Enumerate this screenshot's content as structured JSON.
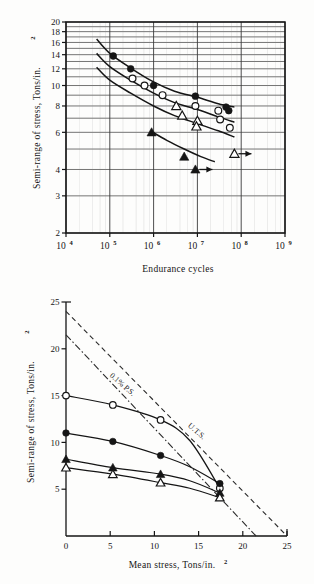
{
  "page": {
    "background_color": "#fdfdfc",
    "ink_color": "#151515"
  },
  "figures": [
    {
      "id": "endurance-curve",
      "chart_data": {
        "type": "line",
        "title": "",
        "subtitle": "",
        "xlabel": "Endurance cycles",
        "ylabel": "Semi-range of stress, Tons/in.",
        "ylabel_sup": "2",
        "xscale": "log",
        "yscale": "log",
        "xlim": [
          10000,
          1000000000
        ],
        "ylim": [
          2,
          20
        ],
        "grid": true,
        "legend_position": "none",
        "xticks": [
          {
            "value": 10000,
            "label": "10",
            "exp": "4"
          },
          {
            "value": 100000,
            "label": "10",
            "exp": "5"
          },
          {
            "value": 1000000,
            "label": "10",
            "exp": "6"
          },
          {
            "value": 10000000,
            "label": "10",
            "exp": "7"
          },
          {
            "value": 100000000,
            "label": "10",
            "exp": "8"
          },
          {
            "value": 1000000000,
            "label": "10",
            "exp": "9"
          }
        ],
        "yticks": [
          {
            "value": 2,
            "label": "2"
          },
          {
            "value": 3,
            "label": "3"
          },
          {
            "value": 4,
            "label": "4"
          },
          {
            "value": 5,
            "label": ""
          },
          {
            "value": 6,
            "label": "6"
          },
          {
            "value": 7,
            "label": ""
          },
          {
            "value": 8,
            "label": "8"
          },
          {
            "value": 9,
            "label": ""
          },
          {
            "value": 10,
            "label": "10"
          },
          {
            "value": 11,
            "label": ""
          },
          {
            "value": 12,
            "label": "12"
          },
          {
            "value": 13,
            "label": ""
          },
          {
            "value": 14,
            "label": "14"
          },
          {
            "value": 15,
            "label": ""
          },
          {
            "value": 16,
            "label": "16"
          },
          {
            "value": 17,
            "label": ""
          },
          {
            "value": 18,
            "label": "18"
          },
          {
            "value": 19,
            "label": ""
          },
          {
            "value": 20,
            "label": "20"
          }
        ],
        "series": [
          {
            "name": "series-filled-circle",
            "marker": "filled-circle",
            "curve": [
              [
                50000,
                16.6
              ],
              [
                100000,
                14.2
              ],
              [
                300000,
                12.1
              ],
              [
                1000000,
                10.4
              ],
              [
                3000000,
                9.4
              ],
              [
                10000000,
                8.8
              ],
              [
                30000000,
                8.2
              ],
              [
                70000000,
                7.9
              ]
            ],
            "points": [
              [
                120000,
                13.8
              ],
              [
                300000,
                12.0
              ],
              [
                1000000,
                10.0
              ],
              [
                9000000,
                8.9
              ],
              [
                45000000,
                7.9
              ],
              [
                52000000,
                7.6
              ]
            ]
          },
          {
            "name": "series-open-circle",
            "marker": "open-circle",
            "curve": [
              [
                50000,
                14.2
              ],
              [
                100000,
                12.3
              ],
              [
                300000,
                10.6
              ],
              [
                1000000,
                9.2
              ],
              [
                3000000,
                8.3
              ],
              [
                10000000,
                7.7
              ],
              [
                30000000,
                7.1
              ],
              [
                70000000,
                6.7
              ]
            ],
            "points": [
              [
                330000,
                10.8
              ],
              [
                620000,
                10.0
              ],
              [
                1600000,
                9.0
              ],
              [
                9000000,
                8.0
              ],
              [
                30000000,
                7.6
              ],
              [
                33000000,
                6.9
              ],
              [
                55000000,
                6.3
              ]
            ]
          },
          {
            "name": "series-open-triangle",
            "marker": "open-triangle",
            "curve": [
              [
                50000,
                12.2
              ],
              [
                100000,
                10.6
              ],
              [
                300000,
                9.2
              ],
              [
                1000000,
                8.0
              ],
              [
                3000000,
                7.2
              ],
              [
                10000000,
                6.6
              ],
              [
                30000000,
                6.1
              ],
              [
                70000000,
                5.7
              ]
            ],
            "points": [
              [
                3300000,
                8.0
              ],
              [
                4500000,
                7.2
              ],
              [
                10000000,
                6.8
              ],
              [
                9500000,
                6.4
              ]
            ],
            "runout_points": [
              [
                70000000,
                4.75
              ]
            ]
          },
          {
            "name": "series-filled-triangle",
            "marker": "filled-triangle",
            "curve": [
              [
                900000,
                6.05
              ],
              [
                2000000,
                5.5
              ],
              [
                5000000,
                5.0
              ],
              [
                12000000,
                4.6
              ],
              [
                25000000,
                4.35
              ]
            ],
            "points": [
              [
                900000,
                6.0
              ],
              [
                5000000,
                4.6
              ]
            ],
            "runout_points": [
              [
                9000000,
                4.0
              ]
            ]
          }
        ]
      }
    },
    {
      "id": "mean-stress-diagram",
      "chart_data": {
        "type": "line",
        "title": "",
        "xlabel": "Mean stress, Tons/in.",
        "xlabel_sup": "2",
        "ylabel": "Semi-range of stress, Tons/in.",
        "ylabel_sup": "2",
        "xscale": "linear",
        "yscale": "linear",
        "xlim": [
          0,
          25
        ],
        "ylim": [
          0,
          25
        ],
        "grid": false,
        "legend_position": "inline-annotations",
        "xticks": [
          {
            "value": 0,
            "label": "0"
          },
          {
            "value": 5,
            "label": "5"
          },
          {
            "value": 10,
            "label": "10"
          },
          {
            "value": 15,
            "label": "15"
          },
          {
            "value": 20,
            "label": "20"
          },
          {
            "value": 25,
            "label": "25"
          }
        ],
        "yticks": [
          {
            "value": 5,
            "label": "5"
          },
          {
            "value": 10,
            "label": "10"
          },
          {
            "value": 15,
            "label": "15"
          },
          {
            "value": 20,
            "label": "20"
          },
          {
            "value": 25,
            "label": "25"
          }
        ],
        "annotations": [
          {
            "name": "uts-line-label",
            "text": "U.T.S.",
            "x": 14.6,
            "y": 11.0,
            "rotation": 41
          },
          {
            "name": "proof-stress-line-label",
            "text": "0.1% P.S.",
            "x": 6.2,
            "y": 16.0,
            "rotation": 41
          }
        ],
        "reference_lines": [
          {
            "name": "uts-line",
            "style": "dashed",
            "label": "U.T.S.",
            "from": [
              0,
              24.0
            ],
            "to": [
              25,
              0.0
            ]
          },
          {
            "name": "proof-stress-line",
            "style": "dash-dot",
            "label": "0.1% P.S.",
            "from": [
              0,
              21.5
            ],
            "to": [
              21.5,
              0.0
            ]
          }
        ],
        "series": [
          {
            "name": "series-open-circle",
            "marker": "open-circle",
            "points": [
              [
                0,
                15.0
              ],
              [
                5.3,
                14.0
              ],
              [
                10.7,
                12.4
              ],
              [
                17.4,
                5.1
              ]
            ],
            "curve": [
              [
                0,
                15.0
              ],
              [
                5.3,
                14.0
              ],
              [
                10.7,
                12.4
              ],
              [
                14.0,
                10.2
              ],
              [
                17.4,
                5.1
              ]
            ]
          },
          {
            "name": "series-filled-circle",
            "marker": "filled-circle",
            "points": [
              [
                0,
                11.0
              ],
              [
                5.3,
                10.1
              ],
              [
                10.7,
                8.6
              ],
              [
                17.4,
                5.6
              ]
            ],
            "curve": [
              [
                0,
                11.0
              ],
              [
                5.3,
                10.1
              ],
              [
                10.7,
                8.6
              ],
              [
                14.0,
                7.4
              ],
              [
                17.4,
                5.6
              ]
            ]
          },
          {
            "name": "series-filled-triangle",
            "marker": "filled-triangle",
            "points": [
              [
                0,
                8.2
              ],
              [
                5.3,
                7.3
              ],
              [
                10.7,
                6.6
              ],
              [
                17.4,
                4.6
              ]
            ],
            "curve": [
              [
                0,
                8.2
              ],
              [
                5.3,
                7.3
              ],
              [
                10.7,
                6.6
              ],
              [
                14.0,
                5.9
              ],
              [
                17.4,
                4.6
              ]
            ]
          },
          {
            "name": "series-open-triangle",
            "marker": "open-triangle",
            "points": [
              [
                0,
                7.3
              ],
              [
                5.3,
                6.6
              ],
              [
                10.7,
                5.7
              ],
              [
                17.4,
                4.1
              ]
            ],
            "curve": [
              [
                0,
                7.3
              ],
              [
                5.3,
                6.6
              ],
              [
                10.7,
                5.7
              ],
              [
                14.0,
                5.1
              ],
              [
                17.4,
                4.1
              ]
            ]
          }
        ]
      }
    }
  ]
}
